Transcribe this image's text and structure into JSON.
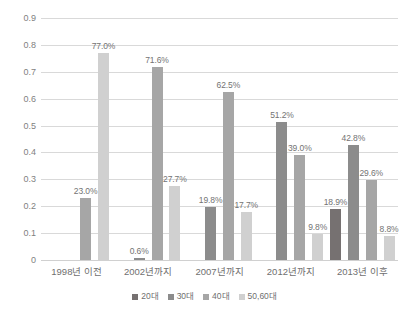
{
  "chart_data": {
    "type": "bar",
    "title": "",
    "xlabel": "",
    "ylabel": "",
    "ylim": [
      0,
      0.9
    ],
    "grid": true,
    "legend_position": "bottom",
    "categories": [
      "1998년 이전",
      "2002년까지",
      "2007년까지",
      "2012년까지",
      "2013년 이후"
    ],
    "y_ticks": [
      "0.9",
      "0.8",
      "0.7",
      "0.6",
      "0.5",
      "0.4",
      "0.3",
      "0.2",
      "0.1",
      "0"
    ],
    "y_tick_values": [
      0.9,
      0.8,
      0.7,
      0.6,
      0.5,
      0.4,
      0.3,
      0.2,
      0.1,
      0
    ],
    "series": [
      {
        "name": "20대",
        "color": "#767171",
        "values": [
          null,
          null,
          null,
          null,
          0.189
        ],
        "labels": [
          "",
          "",
          "",
          "",
          "18.9%"
        ]
      },
      {
        "name": "30대",
        "color": "#8c8c8c",
        "values": [
          null,
          0.006,
          0.198,
          0.512,
          0.428
        ],
        "labels": [
          "",
          "0.6%",
          "19.8%",
          "51.2%",
          "42.8%"
        ]
      },
      {
        "name": "40대",
        "color": "#a6a6a6",
        "values": [
          0.23,
          0.716,
          0.625,
          0.39,
          0.296
        ],
        "labels": [
          "23.0%",
          "71.6%",
          "62.5%",
          "39.0%",
          "29.6%"
        ]
      },
      {
        "name": "50,60대",
        "color": "#d0d0d0",
        "values": [
          0.77,
          0.277,
          0.177,
          0.098,
          0.088
        ],
        "labels": [
          "77.0%",
          "27.7%",
          "17.7%",
          "9.8%",
          "8.8%"
        ]
      }
    ]
  }
}
